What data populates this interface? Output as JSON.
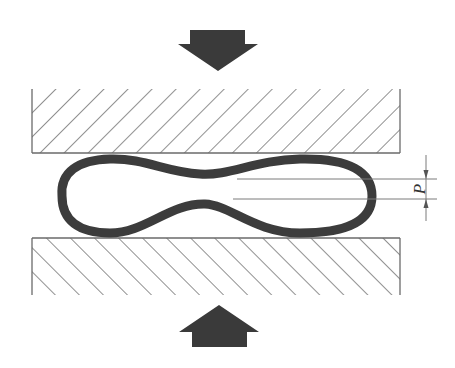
{
  "diagram": {
    "dimension_label": "P",
    "colors": {
      "arrow": "#3a3a3a",
      "tube": "#3c3c3c",
      "hatch": "#555555",
      "plate_border": "#6a6a6a",
      "dimension": "#7a7a7a",
      "background": "#ffffff"
    },
    "elements": {
      "top_arrow": {
        "direction": "down"
      },
      "bottom_arrow": {
        "direction": "up"
      },
      "top_plate": {
        "hatch": "backslash"
      },
      "bottom_plate": {
        "hatch": "slash"
      }
    }
  }
}
